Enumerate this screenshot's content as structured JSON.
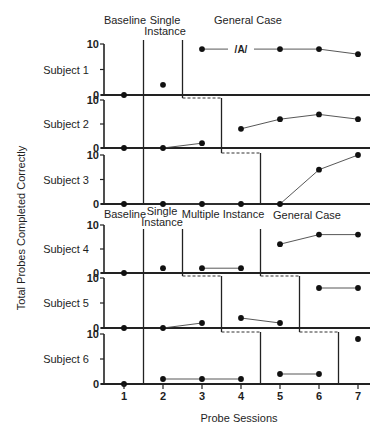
{
  "chart_data": {
    "type": "line",
    "title": "",
    "xlabel": "Probe Sessions",
    "ylabel": "Total Probes Completed Correctly",
    "x": [
      1,
      2,
      3,
      4,
      5,
      6,
      7
    ],
    "x_tick_labels": [
      "1",
      "2",
      "3",
      "4",
      "5",
      "6",
      "7"
    ],
    "ylim": [
      0,
      10
    ],
    "y_ticks": [
      0,
      5,
      10
    ],
    "y_tick_labels": [
      "0",
      "",
      "10"
    ],
    "grid": false,
    "legend": "none",
    "groups": [
      {
        "phases": [
          {
            "label_lines": [
              "Baseline"
            ]
          },
          {
            "label_lines": [
              "Single",
              "Instance"
            ]
          },
          {
            "label_lines": [
              "General Case"
            ]
          }
        ],
        "subjects": [
          0,
          1,
          2
        ]
      },
      {
        "phases": [
          {
            "label_lines": [
              "Baseline"
            ]
          },
          {
            "label_lines": [
              "Single",
              "Instance"
            ]
          },
          {
            "label_lines": [
              "Multiple Instance"
            ]
          },
          {
            "label_lines": [
              "General Case"
            ]
          }
        ],
        "subjects": [
          3,
          4,
          5
        ]
      }
    ],
    "subjects": [
      {
        "name": "Subject 1",
        "values": [
          0,
          2,
          9,
          null,
          9,
          9,
          8
        ],
        "phase_by_session": [
          0,
          1,
          2,
          2,
          2,
          2,
          2
        ],
        "annotations": [
          {
            "session": 4,
            "text": "/A/"
          }
        ]
      },
      {
        "name": "Subject 2",
        "values": [
          0,
          0,
          1,
          4,
          6,
          7,
          6
        ],
        "phase_by_session": [
          0,
          1,
          1,
          2,
          2,
          2,
          2
        ],
        "annotations": []
      },
      {
        "name": "Subject 3",
        "values": [
          0,
          0,
          0,
          0,
          0,
          7,
          10
        ],
        "phase_by_session": [
          0,
          1,
          1,
          1,
          2,
          2,
          2
        ],
        "annotations": []
      },
      {
        "name": "Subject 4",
        "values": [
          0,
          1,
          1,
          1,
          6,
          8,
          8
        ],
        "phase_by_session": [
          0,
          1,
          2,
          2,
          3,
          3,
          3
        ],
        "annotations": []
      },
      {
        "name": "Subject 5",
        "values": [
          0,
          0,
          1,
          2,
          1,
          8,
          8
        ],
        "phase_by_session": [
          0,
          1,
          1,
          2,
          2,
          3,
          3
        ],
        "annotations": []
      },
      {
        "name": "Subject 6",
        "values": [
          0,
          1,
          1,
          1,
          2,
          2,
          9
        ],
        "phase_by_session": [
          0,
          1,
          1,
          1,
          2,
          2,
          3
        ],
        "annotations": []
      }
    ]
  }
}
